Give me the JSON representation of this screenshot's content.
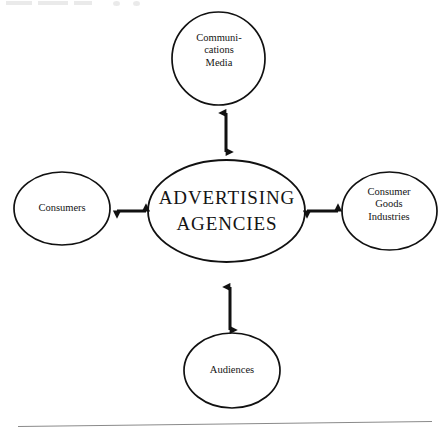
{
  "diagram": {
    "background_color": "#ffffff",
    "stroke_color": "#111111",
    "text_color": "#141414",
    "nodes": {
      "media": {
        "label": "Communi-\ncations\nMedia",
        "shape": "circle",
        "position": "top"
      },
      "center": {
        "label": "ADVERTISING\nAGENCIES",
        "shape": "ellipse",
        "position": "center"
      },
      "consumers": {
        "label": "Consumers",
        "shape": "circle",
        "position": "left"
      },
      "industries": {
        "label": "Consumer\nGoods\nIndustries",
        "shape": "circle",
        "position": "right"
      },
      "audiences": {
        "label": "Audiences",
        "shape": "circle",
        "position": "bottom"
      }
    },
    "connectors": [
      {
        "from": "center",
        "to": "media",
        "style": "double-headed-arrow",
        "orientation": "vertical"
      },
      {
        "from": "center",
        "to": "consumers",
        "style": "double-headed-arrow",
        "orientation": "horizontal"
      },
      {
        "from": "center",
        "to": "industries",
        "style": "double-headed-arrow",
        "orientation": "horizontal"
      },
      {
        "from": "center",
        "to": "audiences",
        "style": "double-headed-arrow",
        "orientation": "vertical"
      }
    ],
    "page_rule": {
      "present": true,
      "description": "thin slanted horizontal scan edge near bottom"
    }
  }
}
